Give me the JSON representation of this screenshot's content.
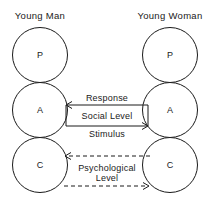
{
  "diagram": {
    "background_color": "#ffffff",
    "line_color": "#1a1a1a",
    "columns": [
      {
        "id": "left",
        "header": "Young Man",
        "ego_states": [
          {
            "code": "P",
            "name": "Parent"
          },
          {
            "code": "A",
            "name": "Adult"
          },
          {
            "code": "C",
            "name": "Child"
          }
        ]
      },
      {
        "id": "right",
        "header": "Young Woman",
        "ego_states": [
          {
            "code": "P",
            "name": "Parent"
          },
          {
            "code": "A",
            "name": "Adult"
          },
          {
            "code": "C",
            "name": "Child"
          }
        ]
      }
    ],
    "transactions": [
      {
        "id": "response",
        "label": "Response",
        "level": "Social Level",
        "style": "solid",
        "direction": "left",
        "from": "right-A",
        "to": "left-A"
      },
      {
        "id": "stimulus",
        "label": "Stimulus",
        "level": "Social Level",
        "style": "solid",
        "direction": "right",
        "from": "left-A",
        "to": "right-A"
      },
      {
        "id": "psych-response",
        "label": "",
        "level": "Psychological Level",
        "style": "dashed",
        "direction": "left",
        "from": "right-C",
        "to": "left-C"
      },
      {
        "id": "psych-stimulus",
        "label": "",
        "level": "Psychological Level",
        "style": "dashed",
        "direction": "right",
        "from": "left-C",
        "to": "right-C"
      }
    ],
    "level_labels": {
      "social": "Social Level",
      "psychological_line1": "Psychological",
      "psychological_line2": "Level"
    }
  }
}
